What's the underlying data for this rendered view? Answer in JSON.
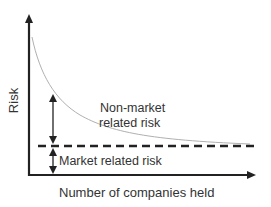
{
  "diagram": {
    "type": "risk-diversification",
    "y_axis_label": "Risk",
    "x_axis_label": "Number of companies held",
    "labels": {
      "non_market_line1": "Non-market",
      "non_market_line2": "related risk",
      "market": "Market related risk"
    },
    "colors": {
      "axis": "#222222",
      "curve": "#b0b0b0",
      "dashed_line": "#222222",
      "text": "#333333"
    }
  }
}
